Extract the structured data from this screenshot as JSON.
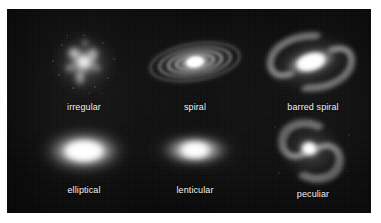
{
  "figure": {
    "background_color": "#040404",
    "label_color": "#f2f2f2",
    "page_background": "#ffffff",
    "panel": {
      "x": 7,
      "y": 9,
      "width": 364,
      "height": 204
    },
    "grid": {
      "rows": 2,
      "columns": 3
    }
  },
  "galaxies": [
    {
      "id": "irregular",
      "label": "irregular",
      "row": 1,
      "column": 1,
      "shape": "clumpy-diffuse-blob",
      "orientation": "none",
      "core_brightness": "medium",
      "has_arms": false,
      "has_bar": false,
      "cell": {
        "x": 22,
        "y": 14,
        "width": 110,
        "height": 90
      },
      "label_y": 93
    },
    {
      "id": "spiral",
      "label": "spiral",
      "row": 1,
      "column": 2,
      "shape": "inclined-disk-with-rings",
      "orientation": "inclined",
      "core_brightness": "high",
      "has_arms": true,
      "has_bar": false,
      "cell": {
        "x": 130,
        "y": 14,
        "width": 116,
        "height": 90
      },
      "label_y": 93
    },
    {
      "id": "barred-spiral",
      "label": "barred spiral",
      "row": 1,
      "column": 3,
      "shape": "bar-with-two-sweeping-arms",
      "orientation": "inclined",
      "core_brightness": "high",
      "has_arms": true,
      "has_bar": true,
      "cell": {
        "x": 248,
        "y": 14,
        "width": 116,
        "height": 90
      },
      "label_y": 93
    },
    {
      "id": "elliptical",
      "label": "elliptical",
      "row": 2,
      "column": 1,
      "shape": "smooth-ellipsoid",
      "orientation": "horizontal",
      "core_brightness": "high",
      "has_arms": false,
      "has_bar": false,
      "cell": {
        "x": 22,
        "y": 110,
        "width": 110,
        "height": 74
      },
      "label_y": 180
    },
    {
      "id": "lenticular",
      "label": "lenticular",
      "row": 2,
      "column": 2,
      "shape": "lens-disk-with-halo",
      "orientation": "horizontal",
      "core_brightness": "high",
      "has_arms": false,
      "has_bar": false,
      "cell": {
        "x": 130,
        "y": 110,
        "width": 116,
        "height": 74
      },
      "label_y": 180
    },
    {
      "id": "peculiar",
      "label": "peculiar",
      "row": 2,
      "column": 3,
      "shape": "face-on-asymmetric-spiral",
      "orientation": "face-on",
      "core_brightness": "high",
      "has_arms": true,
      "has_bar": false,
      "cell": {
        "x": 256,
        "y": 108,
        "width": 100,
        "height": 76
      },
      "label_y": 180
    }
  ]
}
